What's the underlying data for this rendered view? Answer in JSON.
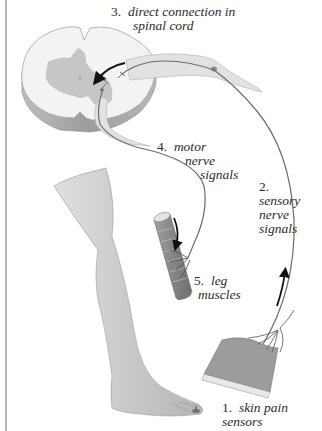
{
  "diagram": {
    "type": "reflex-arc",
    "colors": {
      "background": "#ffffff",
      "border": "#6a6a6a",
      "spinal_white": "#f2f2f2",
      "spinal_gray": "#c4c4c4",
      "spinal_side": "#a8a8a8",
      "nerve": "#e2e2e2",
      "nerve_line": "#6b6b6b",
      "leg": "#cfcfcf",
      "muscle": "#8f8f8f",
      "skin": "#9b9b9b",
      "arrow": "#111111",
      "text": "#2a2a2a"
    },
    "labels": [
      {
        "id": "skin-pain-sensors",
        "number": "1.",
        "lines": [
          "skin pain",
          "sensors"
        ]
      },
      {
        "id": "sensory-nerve-signals",
        "number": "2.",
        "lines": [
          "sensory",
          "nerve",
          "signals"
        ]
      },
      {
        "id": "direct-connection",
        "number": "3.",
        "lines": [
          "direct connection in",
          "spinal cord"
        ]
      },
      {
        "id": "motor-nerve-signals",
        "number": "4.",
        "lines": [
          "motor",
          "nerve",
          "signals"
        ]
      },
      {
        "id": "leg-muscles",
        "number": "5.",
        "lines": [
          "leg",
          "muscles"
        ]
      }
    ],
    "parts": {
      "spinal_cord": "spinal cord cross-section",
      "sensory_nerve": "sensory nerve pathway",
      "motor_nerve": "motor nerve pathway",
      "leg": "leg",
      "muscle": "leg muscle",
      "skin": "skin patch",
      "stimulus": "pain stimulus (tack)"
    }
  }
}
